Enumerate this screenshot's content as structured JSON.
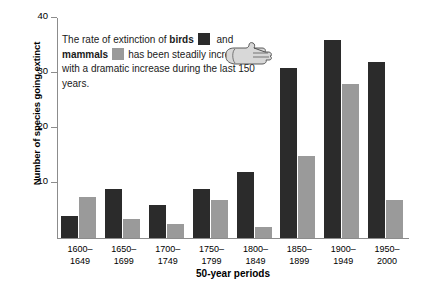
{
  "chart_data": {
    "type": "bar",
    "title": "",
    "xlabel": "50-year periods",
    "ylabel": "Number of species going extinct",
    "categories": [
      "1600–1649",
      "1650–1699",
      "1700–1749",
      "1750–1799",
      "1800–1849",
      "1850–1899",
      "1900–1949",
      "1950–2000"
    ],
    "category_lines": [
      [
        "1600–",
        "1649"
      ],
      [
        "1650–",
        "1699"
      ],
      [
        "1700–",
        "1749"
      ],
      [
        "1750–",
        "1799"
      ],
      [
        "1800–",
        "1849"
      ],
      [
        "1850–",
        "1899"
      ],
      [
        "1900–",
        "1949"
      ],
      [
        "1950–",
        "2000"
      ]
    ],
    "series": [
      {
        "name": "birds",
        "color": "#2b2b2b",
        "values": [
          4,
          9,
          6,
          9,
          12,
          31,
          36,
          32
        ]
      },
      {
        "name": "mammals",
        "color": "#9a9a9a",
        "values": [
          7.5,
          3.5,
          2.5,
          7,
          2,
          15,
          28,
          7
        ]
      }
    ],
    "ylim": [
      0,
      40
    ],
    "yticks": [
      10,
      20,
      30,
      40
    ],
    "ytick_labels": [
      "10",
      "20",
      "30",
      "40"
    ],
    "grid": false,
    "legend_position": "inline-caption"
  },
  "caption": {
    "part1": "The rate of extinction of ",
    "birds_label": "birds",
    "part2": " and ",
    "mammals_label": "mammals",
    "part3": "has been steadily increasing, with a dramatic increase during the last 150 years."
  },
  "icons": {
    "hand": "pointing-hand-icon"
  },
  "colors": {
    "birds": "#2b2b2b",
    "mammals": "#9a9a9a",
    "axis": "#8c8c8c",
    "background": "#ffffff"
  }
}
